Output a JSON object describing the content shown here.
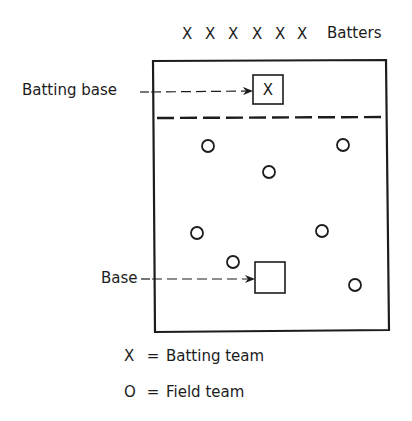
{
  "diagram": {
    "colors": {
      "ink": "#1c1c1c",
      "background": "#ffffff"
    },
    "batters": {
      "symbols": [
        "X",
        "X",
        "X",
        "X",
        "X",
        "X"
      ],
      "label": "Batters"
    },
    "callouts": {
      "batting_base": "Batting base",
      "base": "Base"
    },
    "batting_base_marker": "X",
    "field_players_count": 8,
    "legend": [
      {
        "symbol": "X",
        "equals": "=",
        "meaning": "Batting team"
      },
      {
        "symbol": "O",
        "equals": "=",
        "meaning": "Field team"
      }
    ]
  }
}
